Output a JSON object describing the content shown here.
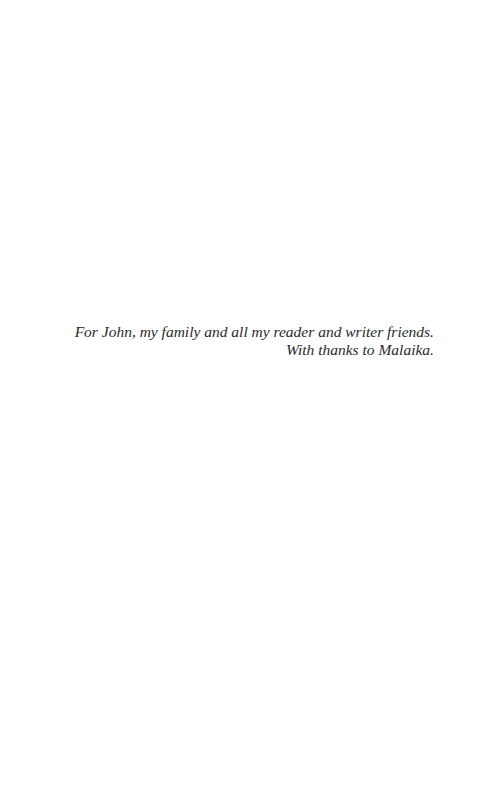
{
  "page": {
    "dedication": {
      "lines": [
        "For John, my family and all my reader and writer friends.",
        "With thanks to Malaika."
      ]
    }
  }
}
